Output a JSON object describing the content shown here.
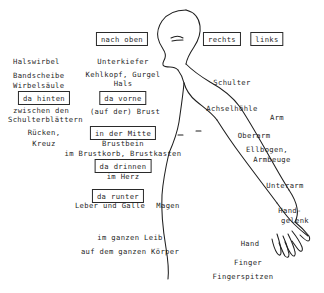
{
  "page": {
    "width": 324,
    "height": 293,
    "background_color": "#ffffff",
    "ink_color": "#1f1f1f"
  },
  "figure": {
    "name": "human-body-profile-outline"
  },
  "boxed_labels": [
    {
      "id": "nach-oben",
      "text": "nach oben",
      "x": 122,
      "y": 32
    },
    {
      "id": "rechts",
      "text": "rechts",
      "x": 222,
      "y": 32
    },
    {
      "id": "links",
      "text": "links",
      "x": 267,
      "y": 32
    },
    {
      "id": "da-hinten",
      "text": "da hinten",
      "x": 44,
      "y": 91
    },
    {
      "id": "da-vorne",
      "text": "da vorne",
      "x": 123,
      "y": 91
    },
    {
      "id": "in-der-mitte",
      "text": "in der Mitte",
      "x": 123,
      "y": 126
    },
    {
      "id": "da-drinnen",
      "text": "da drinnen",
      "x": 123,
      "y": 159
    },
    {
      "id": "da-runter",
      "text": "da runter",
      "x": 118,
      "y": 189
    }
  ],
  "plain_labels": [
    {
      "id": "halswirbel",
      "text": "Halswirbel",
      "x": 13,
      "y": 57,
      "align": "left"
    },
    {
      "id": "bandscheibe",
      "text": "Bandscheibe",
      "x": 13,
      "y": 71,
      "align": "left"
    },
    {
      "id": "wirbelsaeule",
      "text": "Wirbelsäule",
      "x": 13,
      "y": 81,
      "align": "left"
    },
    {
      "id": "zwischen-den",
      "text": "zwischen den",
      "x": 13,
      "y": 106,
      "align": "left"
    },
    {
      "id": "schulterblaettern",
      "text": "Schulterblättern",
      "x": 8,
      "y": 115,
      "align": "left"
    },
    {
      "id": "ruecken",
      "text": "Rücken,",
      "x": 44,
      "y": 128,
      "align": "center"
    },
    {
      "id": "kreuz",
      "text": "Kreuz",
      "x": 44,
      "y": 139,
      "align": "center"
    },
    {
      "id": "unterkiefer",
      "text": "Unterkiefer",
      "x": 123,
      "y": 57,
      "align": "center"
    },
    {
      "id": "kehlkopf-gurgel",
      "text": "Kehlkopf, Gurgel",
      "x": 123,
      "y": 70,
      "align": "center"
    },
    {
      "id": "hals",
      "text": "Hals",
      "x": 123,
      "y": 79,
      "align": "center"
    },
    {
      "id": "auf-der-brust",
      "text": "(auf der) Brust",
      "x": 125,
      "y": 107,
      "align": "center"
    },
    {
      "id": "brustbein",
      "text": "Brustbein",
      "x": 123,
      "y": 139,
      "align": "center"
    },
    {
      "id": "im-brustkorb",
      "text": "im Brustkorb, Brustkasten",
      "x": 123,
      "y": 149,
      "align": "center"
    },
    {
      "id": "im-herz",
      "text": "im Herz",
      "x": 123,
      "y": 172,
      "align": "center"
    },
    {
      "id": "leber-und-galle",
      "text": "Leber und Galle",
      "x": 110,
      "y": 201,
      "align": "center"
    },
    {
      "id": "magen",
      "text": "Magen",
      "x": 168,
      "y": 201,
      "align": "center"
    },
    {
      "id": "im-ganzen-leib",
      "text": "im ganzen Leib",
      "x": 130,
      "y": 233,
      "align": "center"
    },
    {
      "id": "auf-dem-ganzen-koerper",
      "text": "auf dem ganzen Körper",
      "x": 130,
      "y": 247,
      "align": "center"
    },
    {
      "id": "schulter",
      "text": "Schulter",
      "x": 232,
      "y": 78,
      "align": "center"
    },
    {
      "id": "achselhoehle",
      "text": "Achselhöhle",
      "x": 232,
      "y": 104,
      "align": "center"
    },
    {
      "id": "arm",
      "text": "Arm",
      "x": 277,
      "y": 113,
      "align": "center"
    },
    {
      "id": "oberarm",
      "text": "Oberarm",
      "x": 254,
      "y": 131,
      "align": "center"
    },
    {
      "id": "ellbogen",
      "text": "Ellbogen,",
      "x": 267,
      "y": 145,
      "align": "center"
    },
    {
      "id": "armbeuge",
      "text": "Armbeuge",
      "x": 272,
      "y": 155,
      "align": "center"
    },
    {
      "id": "unterarm",
      "text": "Unterarm",
      "x": 285,
      "y": 181,
      "align": "center"
    },
    {
      "id": "hand-gelenk-1",
      "text": "Hand-",
      "x": 290,
      "y": 206,
      "align": "center"
    },
    {
      "id": "hand-gelenk-2",
      "text": "gelenk",
      "x": 295,
      "y": 216,
      "align": "center"
    },
    {
      "id": "hand",
      "text": "Hand",
      "x": 250,
      "y": 239,
      "align": "center"
    },
    {
      "id": "finger",
      "text": "Finger",
      "x": 248,
      "y": 258,
      "align": "center"
    },
    {
      "id": "fingerspitzen",
      "text": "Fingerspitzen",
      "x": 243,
      "y": 272,
      "align": "center"
    }
  ]
}
